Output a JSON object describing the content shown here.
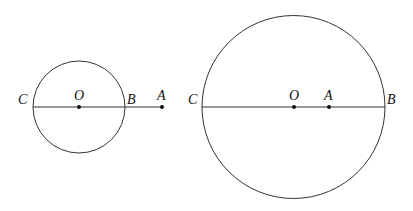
{
  "figure1": {
    "labels": {
      "C": "C",
      "O": "O",
      "B": "B",
      "A": "A"
    },
    "description": "Point A outside circle O on extension of diameter CB"
  },
  "figure2": {
    "labels": {
      "C": "C",
      "O": "O",
      "A": "A",
      "B": "B"
    },
    "description": "Point A inside circle O on diameter CB"
  },
  "colors": {
    "stroke": "#333333",
    "text": "#111111"
  }
}
